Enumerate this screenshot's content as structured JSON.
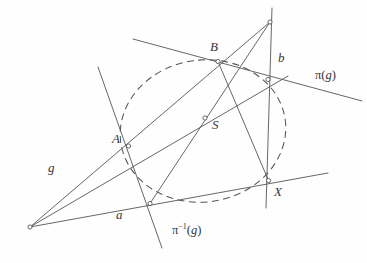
{
  "figure": {
    "kind": "projective-geometry-diagram",
    "width": 367,
    "height": 263,
    "background_color": "#fefefe",
    "stroke_color": "#55565a",
    "label_color": "#35363a",
    "points": [
      {
        "id": "A",
        "label": "A",
        "x": 128.5,
        "y": 146.0,
        "label_x": 112,
        "label_y": 143
      },
      {
        "id": "B",
        "label": "B",
        "x": 218.0,
        "y": 61.5,
        "label_x": 210,
        "label_y": 51
      },
      {
        "id": "S",
        "label": "S",
        "x": 205.0,
        "y": 118.0,
        "label_x": 212,
        "label_y": 129
      },
      {
        "id": "X",
        "label": "X",
        "x": 268.5,
        "y": 180.5,
        "label_x": 274,
        "label_y": 196
      },
      {
        "id": "V_top",
        "label": "",
        "x": 270.0,
        "y": 22.0,
        "label_x": 0,
        "label_y": 0
      },
      {
        "id": "V_left",
        "label": "",
        "x": 30.0,
        "y": 227.0,
        "label_x": 0,
        "label_y": 0
      },
      {
        "id": "P_right",
        "label": "",
        "x": 268.0,
        "y": 79.5,
        "label_x": 0,
        "label_y": 0
      },
      {
        "id": "P_bottom",
        "label": "",
        "x": 150.0,
        "y": 203.5,
        "label_x": 0,
        "label_y": 0
      }
    ],
    "line_labels": [
      {
        "id": "g",
        "label": "g",
        "x": 48,
        "y": 172
      },
      {
        "id": "a",
        "label": "a",
        "x": 116,
        "y": 219
      },
      {
        "id": "b",
        "label": "b",
        "x": 278,
        "y": 62
      }
    ],
    "map_labels": [
      {
        "id": "pi_g",
        "prefix": "π(",
        "arg": "g",
        "suffix": ")",
        "superscript": "",
        "x": 315,
        "y": 79
      },
      {
        "id": "pi_inv_g",
        "prefix": "π",
        "arg": "g",
        "suffix": ")",
        "superscript": "−1",
        "x": 172,
        "y": 234
      }
    ],
    "segments": [
      {
        "id": "line-g",
        "x1": 30.0,
        "y1": 227.0,
        "x2": 270.0,
        "y2": 22.0
      },
      {
        "id": "line-a",
        "x1": 30.0,
        "y1": 227.0,
        "x2": 328.0,
        "y2": 173.0
      },
      {
        "id": "line-through-A-S",
        "x1": 30.0,
        "y1": 227.0,
        "x2": 288.0,
        "y2": 76.0
      },
      {
        "id": "line-b-vertical",
        "x1": 272.0,
        "y1": 8.0,
        "x2": 266.0,
        "y2": 208.0
      },
      {
        "id": "line-pi-g",
        "x1": 133.0,
        "y1": 39.0,
        "x2": 362.0,
        "y2": 101.0
      },
      {
        "id": "line-pi-inv-g",
        "x1": 98.0,
        "y1": 67.0,
        "x2": 162.0,
        "y2": 248.0
      },
      {
        "id": "line-S-to-top",
        "x1": 150.0,
        "y1": 203.5,
        "x2": 270.0,
        "y2": 22.0
      },
      {
        "id": "line-B-to-X",
        "x1": 218.0,
        "y1": 61.5,
        "x2": 268.5,
        "y2": 180.5
      }
    ],
    "conic": {
      "id": "dashed-conic",
      "cx": 203.0,
      "cy": 131.0,
      "rx": 83.0,
      "ry": 71.0,
      "rotation": -8,
      "style": "dashed"
    }
  }
}
